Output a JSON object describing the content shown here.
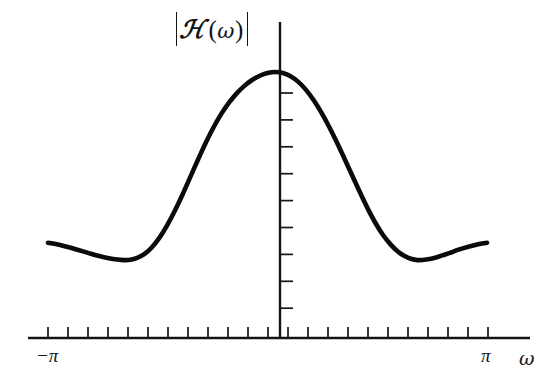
{
  "figure": {
    "kind": "mathematical-plot",
    "background_color": "#ffffff",
    "ink_color": "#141414",
    "y_axis_label": "H(ω)",
    "y_axis_label_script": "ℋ",
    "abs_bar_left": "|",
    "abs_bar_right": "|",
    "x_axis_name": "ω",
    "x_tick_labels": {
      "left": "−π",
      "right": "π"
    }
  },
  "chart_data": {
    "type": "line",
    "title": "",
    "subtitle": "",
    "xlabel": "ω",
    "ylabel": "|ℋ(ω)|",
    "grid": false,
    "legend": false,
    "legend_position": "none",
    "xlim": [
      -3.14159,
      3.14159
    ],
    "ylim": [
      0,
      1.12
    ],
    "xticks_labeled": [
      {
        "value": -3.14159,
        "label": "−π"
      },
      {
        "value": 3.14159,
        "label": "π"
      }
    ],
    "x_tick_count": 23,
    "y_tick_count": 9,
    "y_tick_side": "right",
    "series": [
      {
        "name": "|H(omega)|",
        "color": "#0b0b0b",
        "x": [
          -2.85,
          -2.75,
          -2.62,
          -2.48,
          -2.34,
          -2.2,
          -2.06,
          -1.95,
          -1.86,
          -1.78,
          -1.7,
          -1.6,
          -1.5,
          -1.4,
          -1.3,
          -1.2,
          -1.1,
          -1.0,
          -0.9,
          -0.8,
          -0.7,
          -0.6,
          -0.5,
          -0.4,
          -0.3,
          -0.2,
          -0.1,
          0.0,
          0.1,
          0.2,
          0.3,
          0.4,
          0.5,
          0.6,
          0.7,
          0.8,
          0.9,
          1.0,
          1.1,
          1.2,
          1.3,
          1.4,
          1.5,
          1.6,
          1.7,
          1.78,
          1.86,
          1.95,
          2.06,
          2.2,
          2.34,
          2.48,
          2.62,
          2.75,
          2.85
        ],
        "y": [
          0.357,
          0.352,
          0.343,
          0.332,
          0.32,
          0.308,
          0.299,
          0.294,
          0.292,
          0.293,
          0.299,
          0.314,
          0.34,
          0.377,
          0.424,
          0.479,
          0.54,
          0.605,
          0.67,
          0.733,
          0.79,
          0.84,
          0.882,
          0.917,
          0.945,
          0.967,
          0.983,
          0.993,
          0.997,
          0.993,
          0.981,
          0.96,
          0.93,
          0.891,
          0.845,
          0.792,
          0.734,
          0.672,
          0.609,
          0.546,
          0.486,
          0.432,
          0.386,
          0.35,
          0.322,
          0.307,
          0.297,
          0.292,
          0.294,
          0.303,
          0.316,
          0.331,
          0.343,
          0.352,
          0.357
        ]
      }
    ]
  },
  "geometry": {
    "x_axis_y": 338,
    "x_axis_x0": 28,
    "x_axis_x1": 530,
    "y_axis_x": 280,
    "y_axis_top": 22,
    "x_tick_start": 48,
    "x_tick_spacing": 20,
    "x_tick_length": 11,
    "y_tick_top": 93,
    "y_tick_spacing": 26.9,
    "y_tick_length": 13,
    "curve_x_left": 48,
    "curve_x_right": 487,
    "curve_peak_x": 272,
    "curve_peak_y": 72,
    "curve_baseline_y": 338
  }
}
